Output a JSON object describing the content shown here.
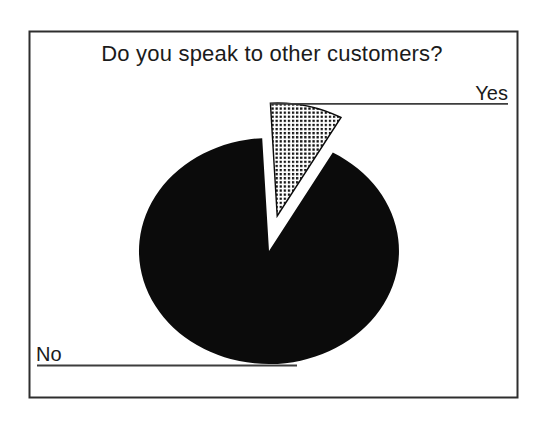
{
  "figure": {
    "paper_color": "#ffffff",
    "frame_color": "#2e2e2e",
    "ink_color": "#0b0b0b",
    "text_color": "#1b1b1b",
    "leader_line_color": "#3d3d3d",
    "dot_pattern_dot_color": "#151515",
    "dot_pattern_bg_color": "#ffffff"
  },
  "chart_data": {
    "type": "pie",
    "title": "Do you speak to other customers?",
    "slices": [
      {
        "label": "No",
        "value": 91,
        "fill_style": "solid-black",
        "exploded": false
      },
      {
        "label": "Yes",
        "value": 9,
        "fill_style": "dotted-square-pattern",
        "exploded": true
      }
    ],
    "values_are_estimates_percent": true,
    "layout": {
      "start_angle_deg": -3,
      "explode_px": 36,
      "legend": "none",
      "labeling": "leader-lines",
      "yes_label_position": "top-right",
      "no_label_position": "bottom-left"
    }
  }
}
